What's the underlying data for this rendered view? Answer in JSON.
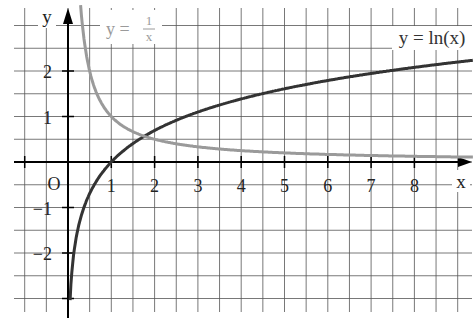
{
  "chart_data": {
    "type": "line",
    "title": "",
    "xlabel": "x",
    "ylabel": "y",
    "origin_label": "O",
    "xlim": [
      -1.2,
      9.3
    ],
    "ylim": [
      -3.2,
      3.4
    ],
    "grid": true,
    "grid_step": 0.5,
    "x_ticks": [
      1,
      2,
      3,
      4,
      5,
      6,
      7,
      8
    ],
    "x_tick_labels": [
      "1",
      "2",
      "3",
      "4",
      "5",
      "6",
      "7",
      "8"
    ],
    "y_ticks": [
      2,
      1,
      -1,
      -2
    ],
    "y_tick_labels": [
      "2",
      "1",
      "−1",
      "−2"
    ],
    "series": [
      {
        "name": "y = ln(x)",
        "function": "ln(x)",
        "color": "#333333",
        "label_position": [
          9.0,
          2.7
        ],
        "points": [
          [
            0.05,
            -3.0
          ],
          [
            0.25,
            -1.39
          ],
          [
            0.5,
            -0.69
          ],
          [
            1,
            0
          ],
          [
            2,
            0.69
          ],
          [
            3,
            1.1
          ],
          [
            4,
            1.39
          ],
          [
            5,
            1.61
          ],
          [
            6,
            1.79
          ],
          [
            7,
            1.95
          ],
          [
            8,
            2.08
          ],
          [
            9.3,
            2.23
          ]
        ]
      },
      {
        "name": "y = 1/x",
        "function": "1/x",
        "color": "#9a9a9a",
        "label_position": [
          1.2,
          3.0
        ],
        "points": [
          [
            0.29,
            3.4
          ],
          [
            0.5,
            2.0
          ],
          [
            1,
            1.0
          ],
          [
            2,
            0.5
          ],
          [
            3,
            0.33
          ],
          [
            4,
            0.25
          ],
          [
            5,
            0.2
          ],
          [
            6,
            0.17
          ],
          [
            7,
            0.14
          ],
          [
            8,
            0.125
          ],
          [
            9.3,
            0.11
          ]
        ]
      }
    ],
    "legend": {
      "ln_label": "y = ln(x)",
      "inv_label_prefix": "y =",
      "inv_label_num": "1",
      "inv_label_den": "x"
    }
  }
}
